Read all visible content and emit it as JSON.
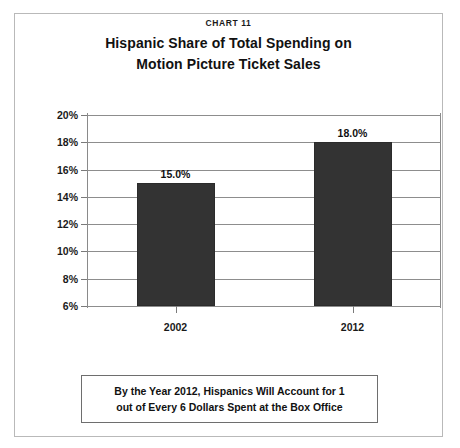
{
  "figure": {
    "chart_number": "CHART 11",
    "title_line_1": "Hispanic Share of Total Spending on",
    "title_line_2": "Motion Picture Ticket Sales",
    "caption_line_1": "By the Year 2012, Hispanics Will Account for 1",
    "caption_line_2": "out of Every 6 Dollars Spent at the Box Office",
    "bar_color": "#333333",
    "border_color": "#b9b9b9",
    "gridline_color": "#8d8d8d"
  },
  "chart_data": {
    "type": "bar",
    "title": "Hispanic Share of Total Spending on Motion Picture Ticket Sales",
    "xlabel": "",
    "ylabel": "",
    "categories": [
      "2002",
      "2012"
    ],
    "values": [
      15.0,
      18.0
    ],
    "data_labels": [
      "15.0%",
      "18.0%"
    ],
    "ylim": [
      6,
      20
    ],
    "ytick_values": [
      6,
      8,
      10,
      12,
      14,
      16,
      18,
      20
    ],
    "ytick_labels": [
      "6%",
      "8%",
      "10%",
      "12%",
      "14%",
      "16%",
      "18%",
      "20%"
    ],
    "grid": true,
    "legend": "none"
  }
}
